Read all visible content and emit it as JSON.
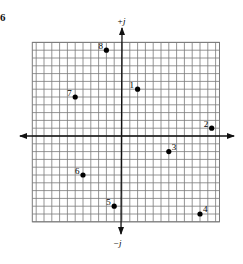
{
  "problem_number": "6",
  "axes": {
    "positive_imag_label": "+j",
    "negative_imag_label": "−j",
    "axis_color": "#111111",
    "grid_color": "#7a7a7a"
  },
  "chart_data": {
    "type": "scatter",
    "title": "",
    "xlabel": "",
    "ylabel": "",
    "y_axis_labels": {
      "top": "+j",
      "bottom": "-j"
    },
    "grid": true,
    "cell_units": 1,
    "xlim": [
      -11.5,
      12.5
    ],
    "ylim": [
      -11,
      12
    ],
    "points": [
      {
        "label": "1",
        "x": 2,
        "y": 6
      },
      {
        "label": "2",
        "x": 11.5,
        "y": 1
      },
      {
        "label": "3",
        "x": 6,
        "y": -2
      },
      {
        "label": "4",
        "x": 10,
        "y": -10
      },
      {
        "label": "5",
        "x": -1,
        "y": -9
      },
      {
        "label": "6",
        "x": -5,
        "y": -5
      },
      {
        "label": "7",
        "x": -6,
        "y": 5
      },
      {
        "label": "8",
        "x": -2,
        "y": 11
      }
    ]
  }
}
